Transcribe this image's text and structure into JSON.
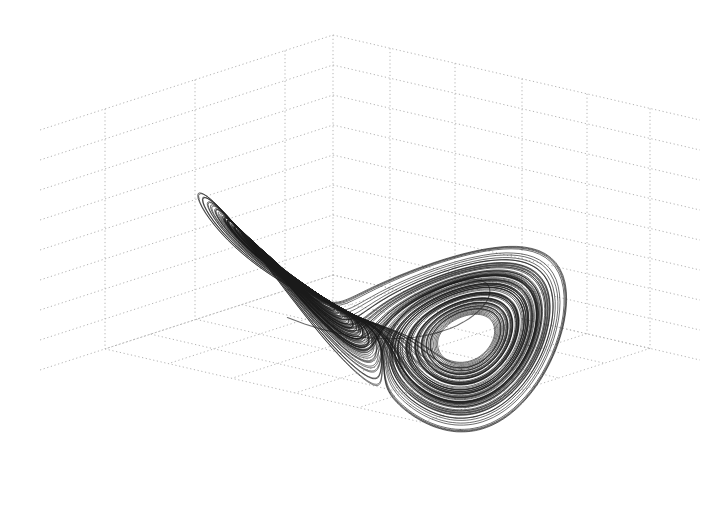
{
  "chart_data": {
    "type": "line",
    "subtype": "3d-trajectory",
    "title": "",
    "xlabel": "",
    "ylabel": "",
    "zlabel": "",
    "legend": [],
    "grid": true,
    "grid_style": "dotted",
    "tick_labels_visible": false,
    "system": {
      "name": "Lorenz",
      "sigma": 10,
      "rho": 28,
      "beta": 2.6667,
      "initial_state": [
        -8,
        20,
        45
      ],
      "dt": 0.006,
      "steps": 24000
    },
    "projection": {
      "center_px": [
        383,
        262
      ],
      "scale_x": 7.2,
      "scale_y": 6.2,
      "scale_z": 4.2,
      "z_offset": 25,
      "rotation_deg": 0
    },
    "series": [
      {
        "name": "trajectory",
        "color": "#1a1a1a",
        "outline_color": "#6e6e6e"
      }
    ],
    "grid_box": {
      "back_corner_px": [
        333,
        35
      ],
      "back_corner_bottom_px": [
        333,
        400
      ],
      "left_wall_verticals_x": [
        105,
        195,
        285
      ],
      "right_wall_verticals_x": [
        390,
        455,
        522,
        587,
        650
      ],
      "horizontal_spacing_px": 30,
      "left_edge_x": 40,
      "right_edge_x": 700
    }
  },
  "colors": {
    "background": "#ffffff",
    "grid": "#b4b4b4",
    "curve": "#1a1a1a",
    "curve_light": "#6e6e6e"
  }
}
